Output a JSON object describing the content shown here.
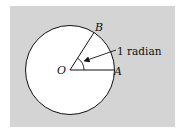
{
  "diagram": {
    "colors": {
      "background": "#d4d4d4",
      "circle_fill": "#ffffff",
      "stroke": "#111111"
    },
    "points": {
      "O": {
        "label": "O"
      },
      "A": {
        "label": "A"
      },
      "B": {
        "label": "B"
      }
    },
    "annotation": {
      "label": "1 radian"
    }
  }
}
